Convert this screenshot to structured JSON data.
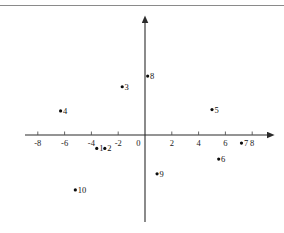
{
  "chart_data": {
    "type": "scatter",
    "title": "",
    "xlabel": "",
    "ylabel": "",
    "xlim": [
      -9.2,
      9.2
    ],
    "ylim": [
      -6.2,
      6.2
    ],
    "grid": false,
    "legend": "none",
    "x_ticks": [
      -8,
      -6,
      -4,
      -2,
      0,
      2,
      4,
      6,
      8
    ],
    "x_tick_labels": [
      "-8",
      "-6",
      "-4",
      "-2",
      "0",
      "2",
      "4",
      "6",
      "8"
    ],
    "y_ticks": [],
    "y_tick_labels": [],
    "axes_style": "centered-arrows",
    "point_labels": [
      "1",
      "2",
      "3",
      "4",
      "5",
      "6",
      "7",
      "8",
      "9",
      "10"
    ],
    "points": [
      {
        "label": "1",
        "x": -3.6,
        "y": -1.0
      },
      {
        "label": "2",
        "x": -3.0,
        "y": -1.0
      },
      {
        "label": "3",
        "x": -1.7,
        "y": 3.6
      },
      {
        "label": "4",
        "x": -6.3,
        "y": 1.8
      },
      {
        "label": "5",
        "x": 5.0,
        "y": 1.9
      },
      {
        "label": "6",
        "x": 5.5,
        "y": -1.8
      },
      {
        "label": "7",
        "x": 7.2,
        "y": -0.6
      },
      {
        "label": "8",
        "x": 0.2,
        "y": 4.4
      },
      {
        "label": "9",
        "x": 0.9,
        "y": -2.9
      },
      {
        "label": "10",
        "x": -5.2,
        "y": -4.1
      }
    ],
    "colors": {
      "marker": "#0d0d0d",
      "axis": "#2b2b2b",
      "tick": "#555555",
      "text": "#111111",
      "background": "#ffffff",
      "border": "#8a8a8a"
    }
  }
}
